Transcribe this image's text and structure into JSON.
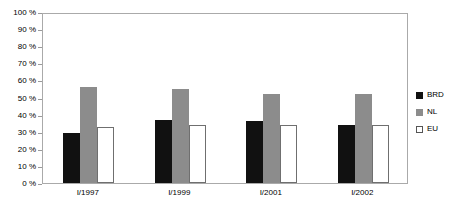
{
  "chart_data": {
    "type": "bar",
    "title": "",
    "xlabel": "",
    "ylabel": "",
    "ylim": [
      0,
      100
    ],
    "grid": false,
    "legend_position": "right",
    "categories": [
      "I/1997",
      "I/1999",
      "I/2001",
      "I/2002"
    ],
    "y_ticks": [
      {
        "value": 100,
        "label": "100 %"
      },
      {
        "value": 90,
        "label": "90 %"
      },
      {
        "value": 80,
        "label": "80 %"
      },
      {
        "value": 70,
        "label": "70 %"
      },
      {
        "value": 60,
        "label": "60 %"
      },
      {
        "value": 50,
        "label": "50 %"
      },
      {
        "value": 40,
        "label": "40 %"
      },
      {
        "value": 30,
        "label": "30 %"
      },
      {
        "value": 20,
        "label": "20 %"
      },
      {
        "value": 10,
        "label": "10 %"
      },
      {
        "value": 0,
        "label": "0 %"
      }
    ],
    "series": [
      {
        "name": "BRD",
        "color": "#111111",
        "values": [
          29,
          37,
          36,
          34
        ]
      },
      {
        "name": "NL",
        "color": "#8c8c8c",
        "values": [
          56,
          55,
          52,
          52
        ]
      },
      {
        "name": "EU",
        "color": "#ffffff",
        "values": [
          33,
          34,
          34,
          34
        ]
      }
    ]
  },
  "legend": {
    "items": [
      {
        "label": "BRD",
        "series_key": "brd"
      },
      {
        "label": "NL",
        "series_key": "nl"
      },
      {
        "label": "EU",
        "series_key": "eu"
      }
    ]
  }
}
